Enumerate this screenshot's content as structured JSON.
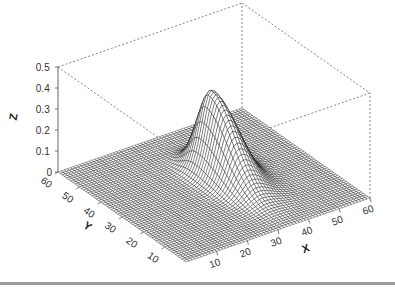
{
  "chart_data": {
    "type": "surface3d",
    "title": "",
    "xlabel": "X",
    "ylabel": "Y",
    "zlabel": "Z",
    "x_ticks": [
      10,
      20,
      30,
      40,
      50,
      60
    ],
    "y_ticks": [
      10,
      20,
      30,
      40,
      50,
      60
    ],
    "z_ticks": [
      "0",
      "0.1",
      "0.2",
      "0.3",
      "0.4",
      "0.5"
    ],
    "xlim": [
      0,
      60
    ],
    "ylim": [
      0,
      60
    ],
    "zlim": [
      0,
      0.5
    ],
    "grid_resolution": 61,
    "surface": {
      "description": "Flat zero surface with a single sharp asymmetric ridge-shaped peak",
      "peak_x": 34,
      "peak_y": 37,
      "peak_z": 0.38,
      "spread_x": 3.2,
      "spread_y": 7.0
    },
    "box": "dotted bounding box",
    "mesh_color": "#000000",
    "face_color": "#ffffff"
  }
}
